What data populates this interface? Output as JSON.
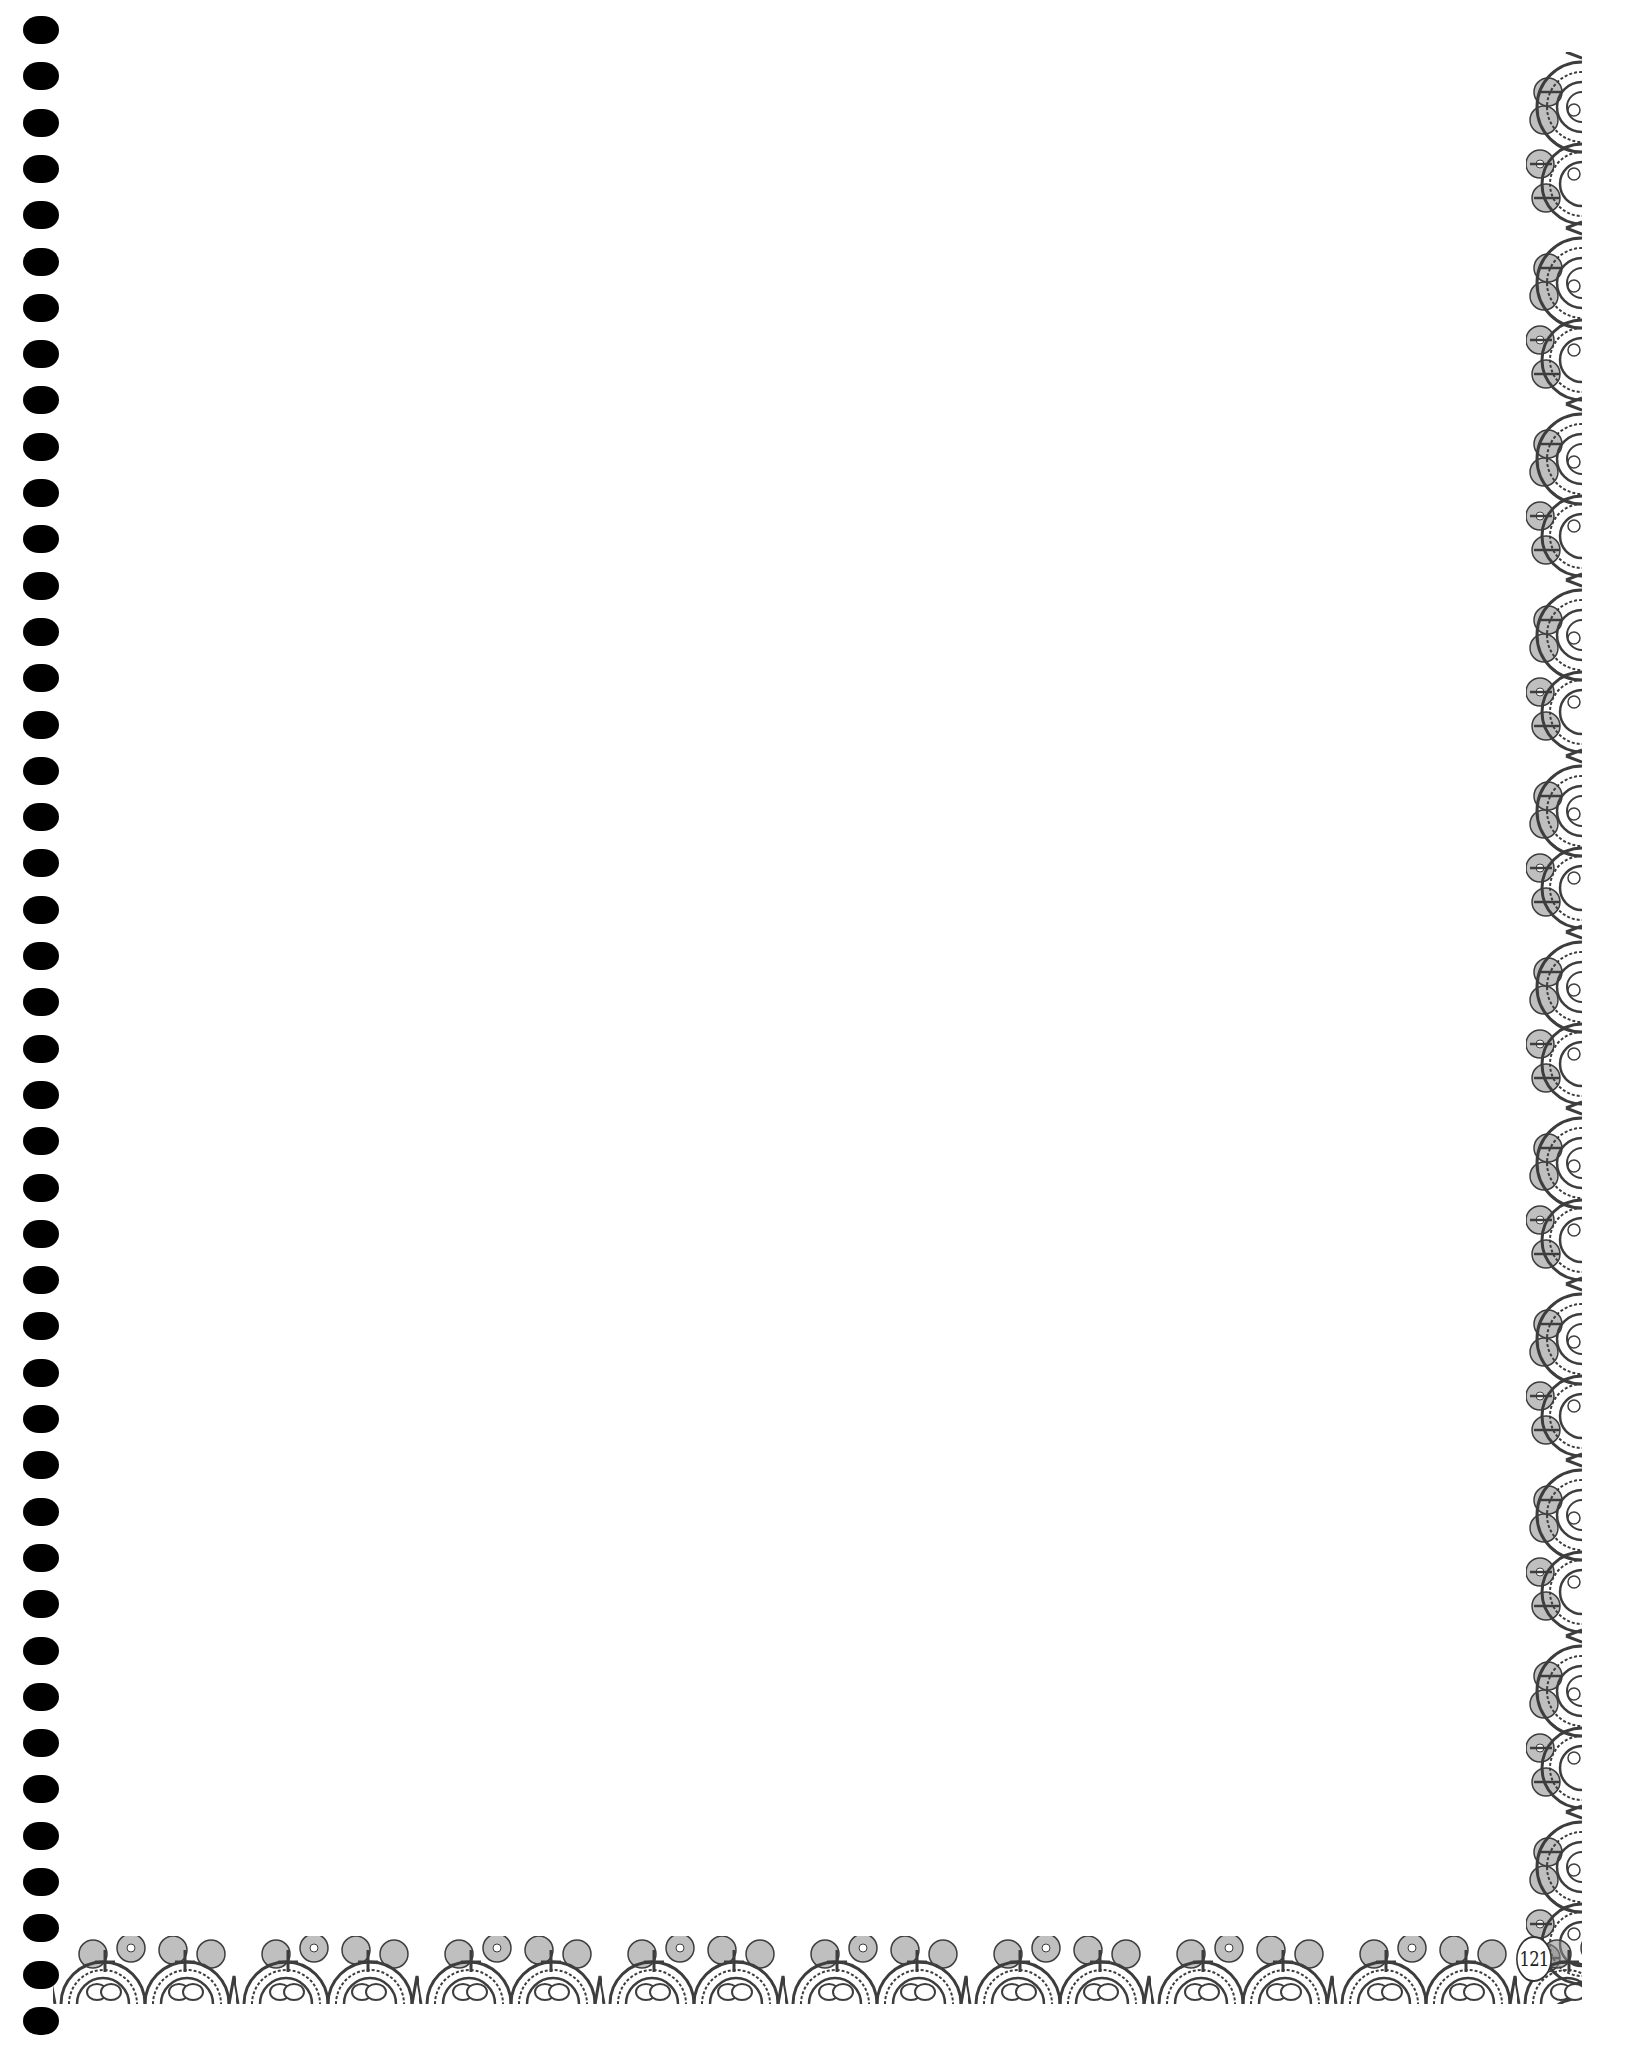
{
  "page": {
    "number": "121",
    "body_text": ""
  },
  "binding": {
    "type": "spiral",
    "hole_count": 44,
    "hole_color": "#000000"
  },
  "border": {
    "style": "crochet-lace",
    "color": "#4a4a4a",
    "sides": [
      "right",
      "bottom"
    ]
  }
}
